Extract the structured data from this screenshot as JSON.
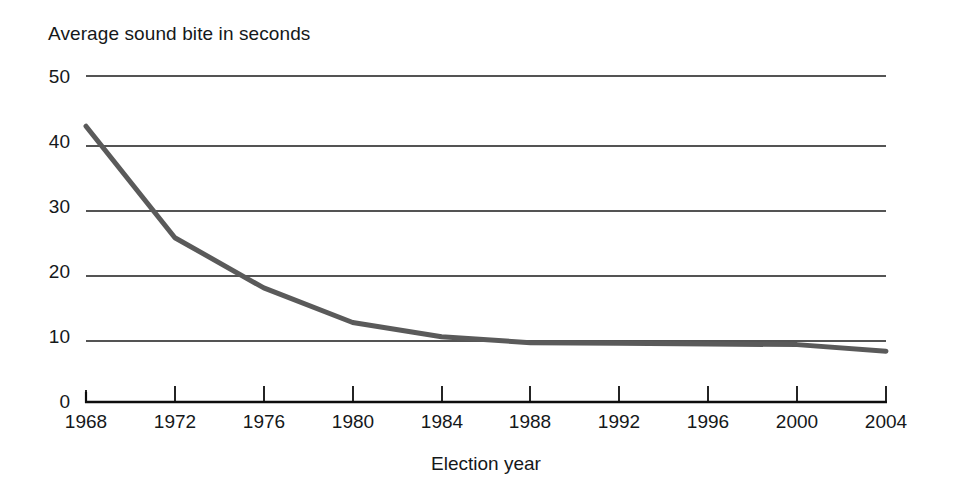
{
  "chart_data": {
    "type": "line",
    "title": "",
    "ylabel": "Average sound bite in seconds",
    "xlabel": "Election year",
    "x": [
      1968,
      1972,
      1976,
      1980,
      1984,
      1988,
      1992,
      1996,
      2000,
      2004
    ],
    "categories": [
      "1968",
      "1972",
      "1976",
      "1980",
      "1984",
      "1988",
      "1992",
      "1996",
      "2000",
      "2004"
    ],
    "values": [
      42.3,
      25.2,
      17.5,
      12.2,
      10.0,
      9.1,
      9.0,
      8.9,
      8.8,
      7.8
    ],
    "series": [
      {
        "name": "Average sound bite in seconds",
        "values": [
          42.3,
          25.2,
          17.5,
          12.2,
          10.0,
          9.1,
          9.0,
          8.9,
          8.8,
          7.8
        ]
      }
    ],
    "ylim": [
      0,
      50
    ],
    "xlim": [
      1968,
      2004
    ],
    "yticks": [
      0,
      10,
      20,
      30,
      40,
      50
    ],
    "ytick_labels": [
      "0",
      "10",
      "20",
      "30",
      "40",
      "50"
    ],
    "xticks": [
      1968,
      1972,
      1976,
      1980,
      1984,
      1988,
      1992,
      1996,
      2000,
      2004
    ],
    "xtick_labels": [
      "1968",
      "1972",
      "1976",
      "1980",
      "1984",
      "1988",
      "1992",
      "1996",
      "2000",
      "2004"
    ],
    "grid": "horizontal",
    "legend": "none",
    "colors": {
      "line": "#5a5a5a",
      "grid": "#1b1b1b",
      "axis": "#0d0d0d",
      "text": "#15181a",
      "background": "#ffffff"
    }
  },
  "axis": {
    "y_title": "Average sound bite in seconds",
    "x_title": "Election year",
    "y_labels": [
      "50",
      "40",
      "30",
      "20",
      "10",
      "0"
    ],
    "x_labels": [
      "1968",
      "1972",
      "1976",
      "1980",
      "1984",
      "1988",
      "1992",
      "1996",
      "2000",
      "2004"
    ]
  }
}
